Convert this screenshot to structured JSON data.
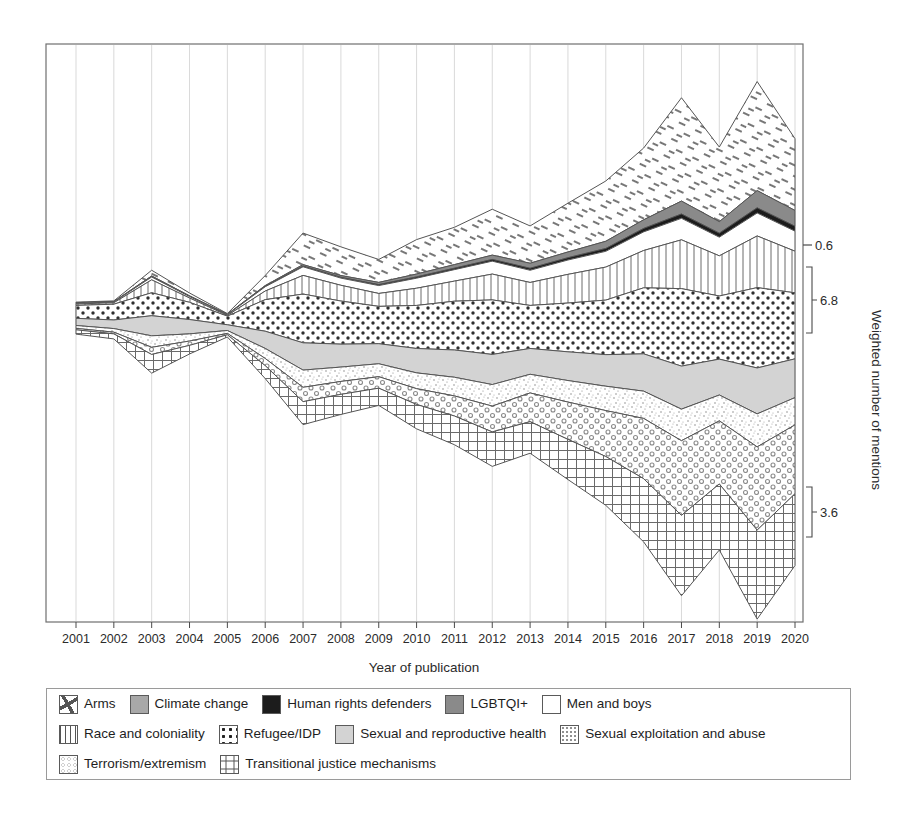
{
  "chart_data": {
    "type": "area",
    "variant": "streamgraph",
    "title": "",
    "xlabel": "Year of publication",
    "ylabel": "Weighted number of mentions",
    "grid": true,
    "legend_position": "bottom",
    "x": [
      2001,
      2002,
      2003,
      2004,
      2005,
      2006,
      2007,
      2008,
      2009,
      2010,
      2011,
      2012,
      2013,
      2014,
      2015,
      2016,
      2017,
      2018,
      2019,
      2020
    ],
    "categories": [
      "2001",
      "2002",
      "2003",
      "2004",
      "2005",
      "2006",
      "2007",
      "2008",
      "2009",
      "2010",
      "2011",
      "2012",
      "2013",
      "2014",
      "2015",
      "2016",
      "2017",
      "2018",
      "2019",
      "2020"
    ],
    "annotations": [
      {
        "label": "0.6",
        "kind": "tick",
        "y_px": 245
      },
      {
        "label": "6.8",
        "kind": "bracket",
        "y_px": 300,
        "span_px": 66
      },
      {
        "label": "3.6",
        "kind": "bracket",
        "y_px": 512,
        "span_px": 50
      }
    ],
    "series": [
      {
        "name": "Arms",
        "pattern": "dashes",
        "fill": "#ffffff",
        "values": [
          0.05,
          0.05,
          0.4,
          0.2,
          0.05,
          0.7,
          2.2,
          2.0,
          1.6,
          2.4,
          2.6,
          3.2,
          2.6,
          3.4,
          4.2,
          5.0,
          7.2,
          5.2,
          7.6,
          5.0
        ]
      },
      {
        "name": "LGBTQI+",
        "pattern": "solid",
        "fill": "#8a8a8a",
        "values": [
          0.02,
          0.02,
          0.05,
          0.03,
          0.02,
          0.05,
          0.1,
          0.12,
          0.15,
          0.2,
          0.25,
          0.3,
          0.35,
          0.4,
          0.5,
          0.6,
          0.9,
          0.8,
          1.2,
          1.1
        ]
      },
      {
        "name": "Human rights defenders",
        "pattern": "solid",
        "fill": "#1c1c1c",
        "values": [
          0.01,
          0.01,
          0.02,
          0.02,
          0.01,
          0.03,
          0.05,
          0.06,
          0.07,
          0.09,
          0.1,
          0.12,
          0.14,
          0.16,
          0.2,
          0.24,
          0.3,
          0.28,
          0.36,
          0.34
        ]
      },
      {
        "name": "Men and boys",
        "pattern": "none",
        "fill": "#ffffff",
        "values": [
          0.05,
          0.05,
          0.2,
          0.1,
          0.05,
          0.3,
          0.6,
          0.5,
          0.55,
          0.7,
          0.8,
          0.9,
          0.85,
          1.0,
          1.1,
          1.3,
          1.5,
          1.3,
          1.6,
          1.4
        ]
      },
      {
        "name": "Race and coloniality",
        "pattern": "vlines",
        "fill": "#ffffff",
        "values": [
          0.1,
          0.1,
          0.9,
          0.3,
          0.05,
          0.6,
          1.3,
          1.1,
          0.9,
          1.2,
          1.4,
          1.8,
          1.6,
          2.0,
          2.3,
          2.6,
          3.4,
          2.8,
          3.6,
          2.9
        ]
      },
      {
        "name": "Refugee/IDP",
        "pattern": "bigdots",
        "fill": "#ffffff",
        "values": [
          0.9,
          1.1,
          1.6,
          1.2,
          0.6,
          2.2,
          3.4,
          3.0,
          2.6,
          3.0,
          3.4,
          3.8,
          3.0,
          3.4,
          3.8,
          4.6,
          5.4,
          4.4,
          5.6,
          4.6
        ]
      },
      {
        "name": "Sexual and reproductive health",
        "pattern": "solid",
        "fill": "#d3d3d3",
        "values": [
          0.5,
          0.6,
          1.4,
          1.0,
          0.4,
          1.2,
          1.9,
          1.6,
          1.4,
          1.7,
          1.9,
          2.1,
          1.8,
          2.0,
          2.2,
          2.6,
          3.0,
          2.5,
          3.2,
          2.7
        ]
      },
      {
        "name": "Sexual exploitation and abuse",
        "pattern": "speckle",
        "fill": "#ffffff",
        "values": [
          0.2,
          0.25,
          0.8,
          0.5,
          0.2,
          0.7,
          1.2,
          1.0,
          0.9,
          1.1,
          1.3,
          1.5,
          1.3,
          1.5,
          1.7,
          1.9,
          2.2,
          1.8,
          2.3,
          1.9
        ]
      },
      {
        "name": "Terrorism/extremism",
        "pattern": "circles",
        "fill": "#ffffff",
        "values": [
          0.1,
          0.12,
          0.5,
          0.3,
          0.1,
          0.5,
          1.0,
          0.9,
          0.8,
          1.1,
          1.4,
          1.8,
          2.0,
          2.6,
          3.2,
          4.2,
          5.2,
          4.4,
          5.8,
          4.8
        ]
      },
      {
        "name": "Transitional justice mechanisms",
        "pattern": "grid",
        "fill": "#ffffff",
        "values": [
          0.3,
          0.35,
          1.3,
          0.6,
          0.15,
          0.9,
          1.6,
          1.4,
          1.2,
          1.7,
          2.0,
          2.4,
          2.2,
          2.8,
          3.4,
          4.4,
          5.6,
          4.6,
          6.2,
          5.0
        ]
      }
    ]
  },
  "legend": {
    "rows": [
      [
        {
          "label": "Arms",
          "pattern": "dashes"
        },
        {
          "label": "Climate change",
          "pattern": "gray-mid"
        },
        {
          "label": "Human rights defenders",
          "pattern": "black"
        },
        {
          "label": "LGBTQI+",
          "pattern": "gray-dark"
        },
        {
          "label": "Men and boys",
          "pattern": "white"
        }
      ],
      [
        {
          "label": "Race and coloniality",
          "pattern": "vlines"
        },
        {
          "label": "Refugee/IDP",
          "pattern": "bigdots"
        },
        {
          "label": "Sexual and reproductive health",
          "pattern": "gray-light"
        },
        {
          "label": "Sexual exploitation and abuse",
          "pattern": "speckle"
        }
      ],
      [
        {
          "label": "Terrorism/extremism",
          "pattern": "circles"
        },
        {
          "label": "Transitional justice mechanisms",
          "pattern": "grid"
        }
      ]
    ]
  },
  "colors": {
    "axis": "#4a4a4a",
    "grid": "#cfcfcf",
    "outline": "#555555",
    "black": "#1c1c1c",
    "gray_dark": "#8a8a8a",
    "gray_mid": "#a8a8a8",
    "gray_light": "#d3d3d3",
    "white": "#ffffff"
  }
}
